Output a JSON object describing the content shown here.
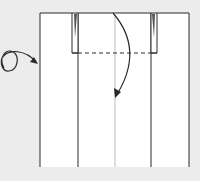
{
  "diagram": {
    "type": "origami-fold-step",
    "background": "#ececec",
    "paper_color": "#ffffff",
    "line_color": "#2a2a2a",
    "crease_color": "#bdbdbd",
    "symbols": [
      {
        "name": "turn-over-symbol",
        "meaning": "turn paper over"
      },
      {
        "name": "valley-fold-line",
        "style": "dashed"
      },
      {
        "name": "fold-down-arrow",
        "meaning": "fold top edge down along dashed line"
      }
    ]
  }
}
